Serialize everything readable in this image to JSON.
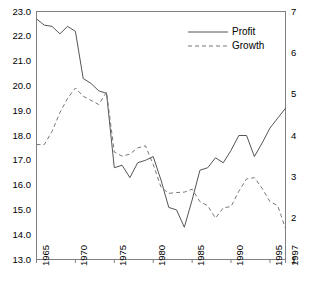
{
  "chart_data": {
    "type": "line",
    "title": "",
    "xlabel": "",
    "ylabel": "",
    "grid": false,
    "legend_position": "top-right",
    "x": [
      1965,
      1966,
      1967,
      1968,
      1969,
      1970,
      1971,
      1972,
      1973,
      1974,
      1975,
      1976,
      1977,
      1978,
      1979,
      1980,
      1981,
      1982,
      1983,
      1984,
      1985,
      1986,
      1987,
      1988,
      1989,
      1990,
      1991,
      1992,
      1993,
      1994,
      1995,
      1996,
      1997
    ],
    "xtick_labels": [
      "1965",
      "1970",
      "1975",
      "1980",
      "1985",
      "1990",
      "1995",
      "1997"
    ],
    "xtick_values": [
      1965,
      1970,
      1975,
      1980,
      1985,
      1990,
      1995,
      1997
    ],
    "xlim": [
      1965,
      1997
    ],
    "left_axis": {
      "name": "Profit",
      "ylim": [
        13.0,
        23.0
      ],
      "ticks": [
        13.0,
        14.0,
        15.0,
        16.0,
        17.0,
        18.0,
        19.0,
        20.0,
        21.0,
        22.0,
        23.0
      ],
      "tick_labels": [
        "13.0",
        "14.0",
        "15.0",
        "16.0",
        "17.0",
        "18.0",
        "19.0",
        "20.0",
        "21.0",
        "22.0",
        "23.0"
      ]
    },
    "right_axis": {
      "name": "Growth",
      "ylim": [
        1,
        7
      ],
      "ticks": [
        1,
        2,
        3,
        4,
        5,
        6,
        7
      ],
      "tick_labels": [
        "1",
        "2",
        "3",
        "4",
        "5",
        "6",
        "7"
      ]
    },
    "series": [
      {
        "name": "Profit",
        "axis": "left",
        "style": "solid",
        "color": "#555555",
        "values": [
          22.7,
          22.45,
          22.4,
          22.1,
          22.4,
          22.2,
          20.3,
          20.1,
          19.8,
          19.7,
          16.7,
          16.8,
          16.3,
          16.9,
          17.0,
          17.15,
          16.2,
          15.1,
          15.0,
          14.3,
          15.4,
          16.6,
          16.7,
          17.1,
          16.9,
          17.4,
          18.0,
          18.0,
          17.15,
          17.7,
          18.3,
          18.7,
          19.1
        ]
      },
      {
        "name": "Growth",
        "axis": "right",
        "style": "dashed",
        "color": "#777777",
        "values": [
          3.78,
          3.78,
          4.1,
          4.55,
          4.9,
          5.15,
          4.95,
          4.85,
          4.75,
          5.05,
          3.6,
          3.5,
          3.55,
          3.7,
          3.75,
          3.3,
          2.75,
          2.6,
          2.62,
          2.63,
          2.7,
          2.4,
          2.3,
          2.0,
          2.25,
          2.28,
          2.65,
          2.95,
          2.98,
          2.72,
          2.4,
          2.3,
          1.75
        ]
      }
    ],
    "legend": [
      {
        "label": "Profit",
        "style": "solid"
      },
      {
        "label": "Growth",
        "style": "dashed"
      }
    ]
  }
}
